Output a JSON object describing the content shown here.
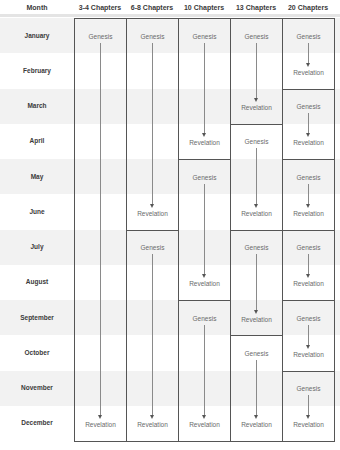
{
  "header": {
    "month_label": "Month",
    "columns": [
      "3-4 Chapters",
      "6-8 Chapters",
      "10 Chapters",
      "13 Chapters",
      "20 Chapters"
    ]
  },
  "months": [
    "January",
    "February",
    "March",
    "April",
    "May",
    "June",
    "July",
    "August",
    "September",
    "October",
    "November",
    "December"
  ],
  "start_label": "Genesis",
  "end_label": "Revelation",
  "plans": [
    {
      "name": "3-4 Chapters",
      "segments": [
        {
          "start": 0,
          "end": 11,
          "start_label": "Genesis",
          "end_label": "Revelation"
        }
      ]
    },
    {
      "name": "6-8 Chapters",
      "segments": [
        {
          "start": 0,
          "end": 5,
          "start_label": "Genesis",
          "end_label": "Revelation"
        },
        {
          "start": 6,
          "end": 11,
          "start_label": "Genesis",
          "end_label": "Revelation"
        }
      ]
    },
    {
      "name": "10 Chapters",
      "segments": [
        {
          "start": 0,
          "end": 3,
          "start_label": "Genesis",
          "end_label": "Revelation"
        },
        {
          "start": 4,
          "end": 7,
          "start_label": "Genesis",
          "end_label": "Revelation"
        },
        {
          "start": 8,
          "end": 11,
          "start_label": "Genesis",
          "end_label": "Revelation"
        }
      ]
    },
    {
      "name": "13 Chapters",
      "segments": [
        {
          "start": 0,
          "end": 2,
          "start_label": "Genesis",
          "end_label": "Revelation"
        },
        {
          "start": 3,
          "end": 5,
          "start_label": "Genesis",
          "end_label": "Revelation"
        },
        {
          "start": 6,
          "end": 8,
          "start_label": "Genesis",
          "end_label": "Revelation"
        },
        {
          "start": 9,
          "end": 11,
          "start_label": "Genesis",
          "end_label": "Revelation"
        }
      ]
    },
    {
      "name": "20 Chapters",
      "segments": [
        {
          "start": 0,
          "end": 1,
          "start_label": "Genesis",
          "end_label": "Revelation"
        },
        {
          "start": 2,
          "end": 3,
          "start_label": "Genesis",
          "end_label": "Revelation"
        },
        {
          "start": 4,
          "end": 5,
          "start_label": "Genesis",
          "end_label": "Revelation"
        },
        {
          "start": 6,
          "end": 7,
          "start_label": "Genesis",
          "end_label": "Revelation"
        },
        {
          "start": 8,
          "end": 9,
          "start_label": "Genesis",
          "end_label": "Revelation"
        },
        {
          "start": 10,
          "end": 11,
          "start_label": "Genesis",
          "end_label": "Revelation"
        }
      ]
    }
  ],
  "colors": {
    "band": "#f2f2f2",
    "border": "#555555",
    "text": "#3a3a3a",
    "label": "#6a6a6a",
    "arrow": "#8a8a8a"
  }
}
